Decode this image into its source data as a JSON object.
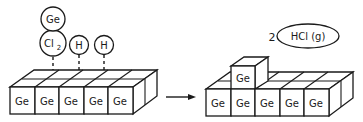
{
  "diagram": {
    "before": {
      "adsorbed_species": [
        {
          "label": "Ge",
          "role": "adatom-bound-to-cl2"
        },
        {
          "label": "Cl",
          "subscript": "2"
        },
        {
          "label": "H"
        },
        {
          "label": "H"
        }
      ],
      "surface_atoms": [
        "Ge",
        "Ge",
        "Ge",
        "Ge",
        "Ge"
      ]
    },
    "arrow": {
      "direction": "right"
    },
    "after": {
      "product": {
        "coefficient": "2",
        "label": "HCl (g)"
      },
      "deposited_atom": "Ge",
      "surface_atoms": [
        "Ge",
        "Ge",
        "Ge",
        "Ge",
        "Ge"
      ]
    }
  }
}
